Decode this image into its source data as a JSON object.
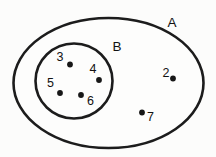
{
  "diagram": {
    "type": "venn",
    "title": "",
    "background_color": "#fcfcfb",
    "stroke_color": "#1c1c1c",
    "dot_color": "#171717",
    "sets": [
      {
        "name": "A",
        "label": "A",
        "shape": "ellipse",
        "label_x": 172,
        "label_y": 23,
        "cx": 108.5,
        "cy": 83,
        "rx": 95,
        "ry": 65
      },
      {
        "name": "B",
        "label": "B",
        "shape": "circle",
        "label_x": 117,
        "label_y": 47,
        "cx": 74,
        "cy": 81,
        "rx": 38.5,
        "ry": 37.5
      }
    ],
    "elements": [
      {
        "label": "3",
        "region": "B",
        "dot_x": 70,
        "dot_y": 64.5,
        "label_x": 60,
        "label_y": 58
      },
      {
        "label": "4",
        "region": "B",
        "dot_x": 99,
        "dot_y": 80,
        "label_x": 93,
        "label_y": 70
      },
      {
        "label": "5",
        "region": "B",
        "dot_x": 60,
        "dot_y": 93,
        "label_x": 50.5,
        "label_y": 84
      },
      {
        "label": "6",
        "region": "B",
        "dot_x": 81,
        "dot_y": 95,
        "label_x": 90.5,
        "label_y": 102
      },
      {
        "label": "2",
        "region": "A-only",
        "dot_x": 173,
        "dot_y": 78.5,
        "label_x": 166,
        "label_y": 74
      },
      {
        "label": "7",
        "region": "A-only",
        "dot_x": 142,
        "dot_y": 112.5,
        "label_x": 150.5,
        "label_y": 118
      }
    ],
    "dot_radius": 2.9
  }
}
